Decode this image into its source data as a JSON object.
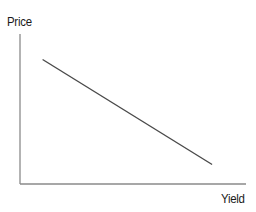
{
  "chart_data": {
    "type": "line",
    "title": "",
    "xlabel": "Yield",
    "ylabel": "Price",
    "grid": false,
    "legend": null,
    "ticks": {
      "x": [],
      "y": []
    },
    "series": [
      {
        "name": "Price-Yield relationship",
        "description": "Inverse linear relationship: price falls as yield rises",
        "x": [
          0.1,
          0.85
        ],
        "y": [
          0.83,
          0.13
        ]
      }
    ],
    "colors": {
      "axis": "#8a8a8a",
      "line": "#4a4a4a",
      "text": "#1a1a1a"
    }
  },
  "labels": {
    "y_axis": "Price",
    "x_axis": "Yield"
  }
}
